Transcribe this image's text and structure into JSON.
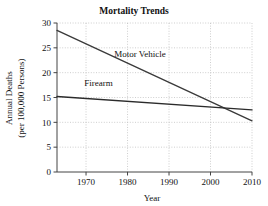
{
  "chart_data": {
    "type": "line",
    "title": "Mortality Trends",
    "xlabel": "Year",
    "ylabel": "Annual Deaths\n(per 100,000 Persons)",
    "ylabel_line1": "Annual Deaths",
    "ylabel_line2": "(per 100,000 Persons)",
    "xlim": [
      1963,
      2010
    ],
    "ylim": [
      0,
      30
    ],
    "xticks": [
      1970,
      1980,
      1990,
      2000,
      2010
    ],
    "yticks": [
      0,
      5,
      10,
      15,
      20,
      25,
      30
    ],
    "grid": true,
    "grid_style": "dotted",
    "legend": "inline-labels",
    "series": [
      {
        "name": "Motor Vehicle",
        "color": "#3a3a3a",
        "label_x": 1983,
        "label_y": 23.2,
        "points": [
          {
            "x": 1963,
            "y": 28.5
          },
          {
            "x": 2010,
            "y": 10.3
          }
        ]
      },
      {
        "name": "Firearm",
        "color": "#2b2b2b",
        "label_x": 1973,
        "label_y": 17.3,
        "points": [
          {
            "x": 1963,
            "y": 15.2
          },
          {
            "x": 2010,
            "y": 12.5
          }
        ]
      }
    ],
    "annotations": []
  },
  "colors": {
    "axis": "#444444",
    "grid": "#b9b9b9",
    "text": "#111111",
    "background": "#ffffff"
  }
}
